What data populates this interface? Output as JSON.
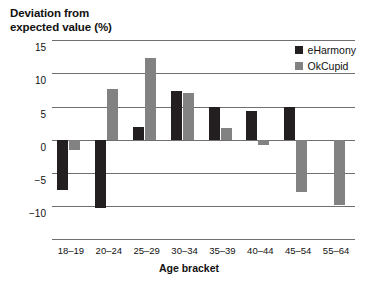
{
  "chart_data": {
    "type": "bar",
    "title": "Deviation from\nexpected value (%)",
    "xlabel": "Age bracket",
    "ylabel": "",
    "ylim": [
      -12.5,
      15
    ],
    "yticks": [
      15,
      10,
      5,
      0,
      -5,
      -10
    ],
    "ytick_labels": [
      "15",
      "10",
      "5",
      "0",
      "−5",
      "−10"
    ],
    "grid": true,
    "legend_position": "top-right",
    "categories": [
      "18–19",
      "20–24",
      "25–29",
      "30–34",
      "35–39",
      "40–44",
      "45–54",
      "55–64"
    ],
    "series": [
      {
        "name": "eHarmony",
        "color": "#231f20",
        "values": [
          -7.5,
          -10.2,
          2.0,
          7.3,
          5.0,
          4.3,
          5.0,
          0.0
        ]
      },
      {
        "name": "OkCupid",
        "color": "#828282",
        "values": [
          -1.6,
          7.6,
          12.3,
          7.0,
          1.8,
          -0.8,
          -7.8,
          -9.8
        ]
      }
    ]
  },
  "colors": {
    "eharmony": "#231f20",
    "okcupid": "#828282",
    "gridline": "#6f6f6f",
    "text": "#111111",
    "background": "#ffffff"
  }
}
